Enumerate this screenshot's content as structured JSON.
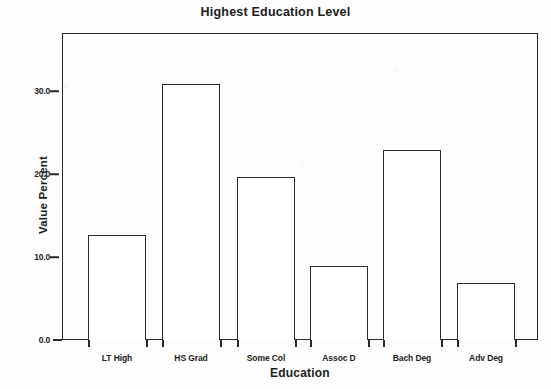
{
  "chart_data": {
    "type": "bar",
    "title": "Highest Education Level",
    "xlabel": "Education",
    "ylabel": "Value Percent",
    "categories": [
      "LT High",
      "HS Grad",
      "Some Col",
      "Assoc D",
      "Bach Deg",
      "Adv Deg"
    ],
    "values": [
      12.6,
      30.8,
      19.6,
      8.9,
      22.9,
      6.9
    ],
    "ylim": [
      0.0,
      37.0
    ],
    "ytick_labels": [
      "0.0",
      "10.0",
      "20.0",
      "30.0"
    ],
    "ytick_values": [
      0.0,
      10.0,
      20.0,
      30.0
    ],
    "grid": false,
    "legend": false,
    "legend_position": "none",
    "bar_fill_color": "#ffffff",
    "bar_edge_color": "#2b2b2b",
    "axis_color": "#2a2a2a",
    "background_color": "#fdfdfd",
    "text_color": "#1c1c1c"
  }
}
